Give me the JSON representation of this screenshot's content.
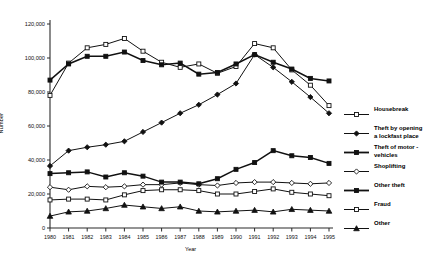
{
  "chart_data": {
    "type": "line",
    "title": "",
    "xlabel": "Year",
    "ylabel": "Number",
    "x": [
      1980,
      1981,
      1982,
      1983,
      1984,
      1985,
      1986,
      1987,
      1988,
      1989,
      1990,
      1991,
      1992,
      1993,
      1994,
      1995
    ],
    "xticklabels": [
      "1980",
      "1981",
      "1982",
      "1983",
      "1984",
      "1985",
      "1986",
      "1987",
      "1988",
      "1989",
      "1990",
      "1991",
      "1992",
      "1993",
      "1994",
      "1995"
    ],
    "yticklabels": [
      "0",
      "20,000",
      "40,000",
      "60,000",
      "80,000",
      "100,000",
      "120,000"
    ],
    "yticks": [
      0,
      20000,
      40000,
      60000,
      80000,
      100000,
      120000
    ],
    "ylim": [
      0,
      120000
    ],
    "xlim": [
      1980,
      1995
    ],
    "grid": false,
    "legend_position": "right",
    "series": [
      {
        "name": "Housebreak",
        "marker": "open-square",
        "values": [
          78000,
          97000,
          106000,
          108000,
          111500,
          104000,
          97500,
          94500,
          96500,
          91000,
          95000,
          108500,
          106000,
          93000,
          84000,
          72000
        ]
      },
      {
        "name": "Theft by opening\na lockfast place",
        "marker": "filled-diamond",
        "values": [
          36500,
          45500,
          47500,
          49000,
          51000,
          56500,
          62000,
          67500,
          72500,
          78500,
          85000,
          102000,
          94500,
          86000,
          77000,
          67500
        ]
      },
      {
        "name": "Theft of motor -\nvehicles",
        "marker": "filled-square",
        "values": [
          87000,
          96500,
          101000,
          101000,
          103500,
          98500,
          96000,
          97000,
          90500,
          91500,
          96500,
          102000,
          97500,
          93500,
          88000,
          86500
        ]
      },
      {
        "name": "Shoplifting",
        "marker": "open-diamond",
        "values": [
          24000,
          22500,
          24500,
          24000,
          24500,
          25500,
          25500,
          26500,
          25500,
          25000,
          26500,
          27000,
          27000,
          26500,
          26000,
          26500
        ]
      },
      {
        "name": "Other theft",
        "marker": "filled-square",
        "values": [
          32000,
          32500,
          33000,
          30000,
          32500,
          30500,
          27000,
          27000,
          26000,
          29000,
          34500,
          38500,
          45500,
          42500,
          41500,
          38000
        ]
      },
      {
        "name": "Fraud",
        "marker": "open-square",
        "values": [
          16500,
          17000,
          17000,
          16500,
          19500,
          22000,
          22500,
          22500,
          22000,
          20000,
          20000,
          21500,
          23000,
          21000,
          20000,
          19000
        ]
      },
      {
        "name": "Other",
        "marker": "filled-triangle",
        "values": [
          7000,
          9500,
          10000,
          11500,
          13500,
          12500,
          11500,
          12500,
          10000,
          9500,
          10000,
          10500,
          9500,
          11000,
          10500,
          10000
        ]
      }
    ]
  }
}
